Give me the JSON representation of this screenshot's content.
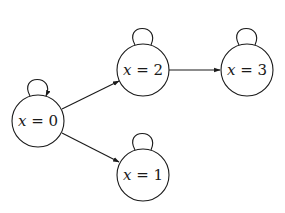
{
  "diagram": {
    "type": "state-transition-graph",
    "nodes": [
      {
        "id": "n0",
        "label_var": "x",
        "label_eq": " = ",
        "label_val": "0",
        "cx": 38,
        "cy": 121,
        "r": 26,
        "self_loop": true
      },
      {
        "id": "n2",
        "label_var": "x",
        "label_eq": " = ",
        "label_val": "2",
        "cx": 143,
        "cy": 70,
        "r": 26,
        "self_loop": true
      },
      {
        "id": "n3",
        "label_var": "x",
        "label_eq": " = ",
        "label_val": "3",
        "cx": 247,
        "cy": 70,
        "r": 26,
        "self_loop": true
      },
      {
        "id": "n1",
        "label_var": "x",
        "label_eq": " = ",
        "label_val": "1",
        "cx": 143,
        "cy": 175,
        "r": 26,
        "self_loop": true
      }
    ],
    "edges": [
      {
        "from": "n0",
        "to": "n2"
      },
      {
        "from": "n0",
        "to": "n1"
      },
      {
        "from": "n2",
        "to": "n3"
      }
    ],
    "colors": {
      "stroke": "#1a1a1a",
      "background": "#ffffff"
    }
  }
}
